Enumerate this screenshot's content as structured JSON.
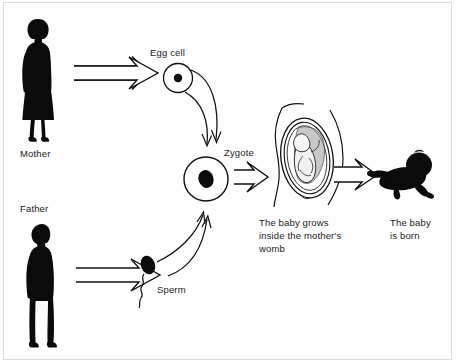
{
  "diagram": {
    "type": "process-flow",
    "background_color": "#ffffff",
    "ink_color": "#000000",
    "labels": {
      "mother": "Mother",
      "father": "Father",
      "egg_cell": "Egg cell",
      "sperm": "Sperm",
      "zygote": "Zygote",
      "womb": "The baby grows\ninside the mother's\nwomb",
      "born": "The baby\nis born"
    },
    "nodes": [
      {
        "id": "mother",
        "icon": "woman-silhouette-icon",
        "label": "Mother",
        "x": 46,
        "y": 80
      },
      {
        "id": "father",
        "icon": "man-silhouette-icon",
        "label": "Father",
        "x": 48,
        "y": 278
      },
      {
        "id": "egg-cell",
        "icon": "egg-cell-icon",
        "label": "Egg cell",
        "x": 178,
        "y": 78
      },
      {
        "id": "sperm",
        "icon": "sperm-icon",
        "label": "Sperm",
        "x": 148,
        "y": 268
      },
      {
        "id": "zygote",
        "icon": "zygote-cell-icon",
        "label": "Zygote",
        "x": 206,
        "y": 179
      },
      {
        "id": "womb",
        "icon": "pregnant-womb-icon",
        "label": "The baby grows inside the mother's womb",
        "x": 305,
        "y": 160
      },
      {
        "id": "baby",
        "icon": "crawling-baby-icon",
        "label": "The baby is born",
        "x": 410,
        "y": 175
      }
    ],
    "edges": [
      {
        "from": "mother",
        "to": "egg-cell",
        "style": "hollow-block-arrow"
      },
      {
        "from": "father",
        "to": "sperm",
        "style": "hollow-block-arrow"
      },
      {
        "from": "egg-cell",
        "to": "zygote",
        "style": "curved-thin-arrow"
      },
      {
        "from": "sperm",
        "to": "zygote",
        "style": "curved-thin-arrow"
      },
      {
        "from": "zygote",
        "to": "womb",
        "style": "hollow-block-arrow"
      },
      {
        "from": "womb",
        "to": "baby",
        "style": "hollow-block-arrow"
      }
    ]
  }
}
